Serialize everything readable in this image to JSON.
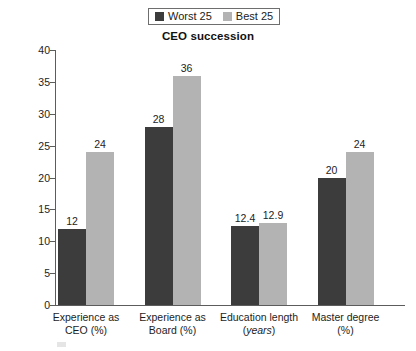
{
  "chart_data": {
    "type": "bar",
    "title": "CEO succession",
    "xlabel": "",
    "ylabel": "",
    "ylim": [
      0,
      40
    ],
    "yticks": [
      0,
      5,
      10,
      15,
      20,
      25,
      30,
      35,
      40
    ],
    "grid": false,
    "legend_position": "top-center",
    "categories": [
      "Experience as CEO (%)",
      "Experience as Board (%)",
      "Education length (years)",
      "Master degree (%)"
    ],
    "category_lines": [
      {
        "line1": "Experience as",
        "line2": "CEO (%)",
        "italic_line2": false
      },
      {
        "line1": "Experience as",
        "line2": "Board (%)",
        "italic_line2": false
      },
      {
        "line1": "Education length",
        "line2": "years",
        "line2_prefix": "(",
        "line2_suffix": ")",
        "italic_line2": true
      },
      {
        "line1": "Master degree",
        "line2": "(%)",
        "italic_line2": false
      }
    ],
    "series": [
      {
        "name": "Worst 25",
        "color": "#3c3c3c",
        "values": [
          12,
          28,
          12.4,
          20
        ],
        "labels": [
          "12",
          "28",
          "12.4",
          "20"
        ]
      },
      {
        "name": "Best 25",
        "color": "#b3b3b3",
        "values": [
          24,
          36,
          12.9,
          24
        ],
        "labels": [
          "24",
          "36",
          "12.9",
          "24"
        ]
      }
    ]
  },
  "legend": {
    "items": [
      {
        "label": "Worst 25",
        "color": "#3c3c3c"
      },
      {
        "label": "Best 25",
        "color": "#b3b3b3"
      }
    ]
  },
  "axis": {
    "tick_labels": [
      "0",
      "5",
      "10",
      "15",
      "20",
      "25",
      "30",
      "35",
      "40"
    ]
  },
  "colors": {
    "worst": "#3c3c3c",
    "best": "#b3b3b3",
    "axis": "#5c5c5c",
    "text": "#1d1d1d",
    "background": "#ffffff"
  }
}
